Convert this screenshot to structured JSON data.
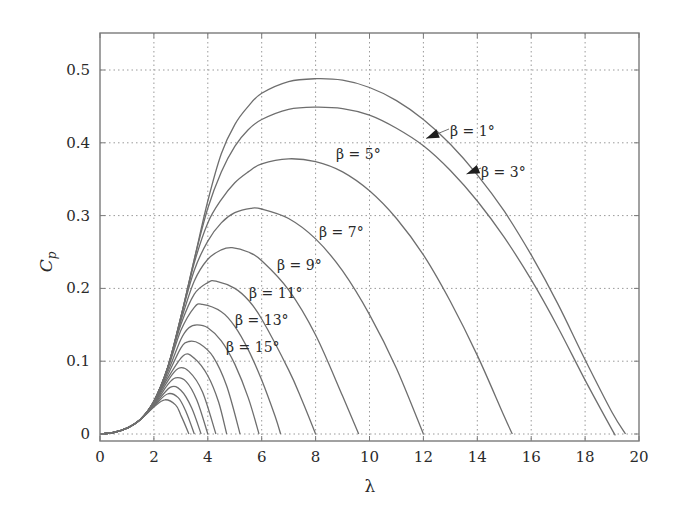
{
  "chart_data": {
    "type": "line",
    "title": "",
    "xlabel": "λ",
    "ylabel": "C_p",
    "xlim": [
      0,
      20
    ],
    "ylim": [
      0,
      0.55
    ],
    "x_ticks": [
      "0",
      "2",
      "4",
      "6",
      "8",
      "10",
      "12",
      "14",
      "16",
      "18",
      "20"
    ],
    "x_tick_values": [
      0,
      2,
      4,
      6,
      8,
      10,
      12,
      14,
      16,
      18,
      20
    ],
    "y_ticks": [
      "0",
      "0.1",
      "0.2",
      "0.3",
      "0.4",
      "0.5"
    ],
    "y_tick_values": [
      0,
      0.1,
      0.2,
      0.3,
      0.4,
      0.5
    ],
    "grid": true,
    "series": [
      {
        "name": "β = 1°",
        "label": "β = 1°",
        "peak": [
          8.3,
          0.488
        ],
        "zero": 19.5,
        "points": [
          [
            0,
            0
          ],
          [
            0.5,
            0.002
          ],
          [
            1,
            0.008
          ],
          [
            1.5,
            0.02
          ],
          [
            2,
            0.045
          ],
          [
            2.5,
            0.09
          ],
          [
            3,
            0.16
          ],
          [
            3.5,
            0.24
          ],
          [
            4,
            0.32
          ],
          [
            4.5,
            0.385
          ],
          [
            5,
            0.425
          ],
          [
            5.5,
            0.45
          ],
          [
            6,
            0.468
          ],
          [
            7,
            0.484
          ],
          [
            8,
            0.488
          ],
          [
            9,
            0.486
          ],
          [
            10,
            0.476
          ],
          [
            11,
            0.458
          ],
          [
            12,
            0.432
          ],
          [
            13,
            0.398
          ],
          [
            14,
            0.356
          ],
          [
            15,
            0.306
          ],
          [
            16,
            0.246
          ],
          [
            17,
            0.178
          ],
          [
            18,
            0.102
          ],
          [
            19,
            0.03
          ],
          [
            19.5,
            0
          ]
        ]
      },
      {
        "name": "β = 3°",
        "label": "β = 3°",
        "peak": [
          8.5,
          0.449
        ],
        "zero": 19.1,
        "points": [
          [
            0,
            0
          ],
          [
            0.5,
            0.002
          ],
          [
            1,
            0.008
          ],
          [
            1.5,
            0.02
          ],
          [
            2,
            0.045
          ],
          [
            2.5,
            0.09
          ],
          [
            3,
            0.16
          ],
          [
            3.5,
            0.24
          ],
          [
            4,
            0.31
          ],
          [
            4.5,
            0.36
          ],
          [
            5,
            0.395
          ],
          [
            5.5,
            0.418
          ],
          [
            6,
            0.432
          ],
          [
            7,
            0.446
          ],
          [
            8,
            0.449
          ],
          [
            9,
            0.447
          ],
          [
            10,
            0.438
          ],
          [
            11,
            0.42
          ],
          [
            12,
            0.396
          ],
          [
            13,
            0.362
          ],
          [
            14,
            0.32
          ],
          [
            15,
            0.27
          ],
          [
            16,
            0.212
          ],
          [
            17,
            0.146
          ],
          [
            18,
            0.074
          ],
          [
            19,
            0.006
          ],
          [
            19.1,
            0
          ]
        ]
      },
      {
        "name": "β = 5°",
        "label": "β = 5°",
        "peak": [
          7.0,
          0.378
        ],
        "zero": 15.3,
        "points": [
          [
            0,
            0
          ],
          [
            0.5,
            0.002
          ],
          [
            1,
            0.008
          ],
          [
            1.5,
            0.02
          ],
          [
            2,
            0.045
          ],
          [
            2.5,
            0.09
          ],
          [
            3,
            0.16
          ],
          [
            3.5,
            0.235
          ],
          [
            4,
            0.29
          ],
          [
            4.5,
            0.322
          ],
          [
            5,
            0.345
          ],
          [
            5.5,
            0.36
          ],
          [
            6,
            0.371
          ],
          [
            7,
            0.378
          ],
          [
            8,
            0.374
          ],
          [
            9,
            0.36
          ],
          [
            10,
            0.334
          ],
          [
            11,
            0.296
          ],
          [
            12,
            0.246
          ],
          [
            13,
            0.182
          ],
          [
            14,
            0.108
          ],
          [
            15,
            0.024
          ],
          [
            15.3,
            0
          ]
        ]
      },
      {
        "name": "β = 7°",
        "label": "β = 7°",
        "peak": [
          5.6,
          0.31
        ],
        "zero": 12.0,
        "points": [
          [
            0,
            0
          ],
          [
            0.5,
            0.002
          ],
          [
            1,
            0.008
          ],
          [
            1.5,
            0.02
          ],
          [
            2,
            0.045
          ],
          [
            2.5,
            0.09
          ],
          [
            3,
            0.16
          ],
          [
            3.5,
            0.225
          ],
          [
            4,
            0.265
          ],
          [
            4.5,
            0.29
          ],
          [
            5,
            0.304
          ],
          [
            5.6,
            0.31
          ],
          [
            6,
            0.309
          ],
          [
            7,
            0.296
          ],
          [
            8,
            0.268
          ],
          [
            9,
            0.224
          ],
          [
            10,
            0.164
          ],
          [
            11,
            0.09
          ],
          [
            12,
            0
          ]
        ]
      },
      {
        "name": "β = 9°",
        "label": "β = 9°",
        "peak": [
          4.9,
          0.256
        ],
        "zero": 9.6,
        "points": [
          [
            0,
            0
          ],
          [
            0.5,
            0.002
          ],
          [
            1,
            0.008
          ],
          [
            1.5,
            0.02
          ],
          [
            2,
            0.045
          ],
          [
            2.5,
            0.09
          ],
          [
            3,
            0.155
          ],
          [
            3.5,
            0.21
          ],
          [
            4,
            0.24
          ],
          [
            4.5,
            0.253
          ],
          [
            4.9,
            0.256
          ],
          [
            5.5,
            0.25
          ],
          [
            6,
            0.238
          ],
          [
            7,
            0.198
          ],
          [
            8,
            0.136
          ],
          [
            9,
            0.052
          ],
          [
            9.6,
            0
          ]
        ]
      },
      {
        "name": "β = 11°",
        "label": "β = 11°",
        "peak": [
          4.3,
          0.21
        ],
        "zero": 8.0,
        "points": [
          [
            0,
            0
          ],
          [
            0.5,
            0.002
          ],
          [
            1,
            0.008
          ],
          [
            1.5,
            0.02
          ],
          [
            2,
            0.045
          ],
          [
            2.5,
            0.09
          ],
          [
            3,
            0.15
          ],
          [
            3.5,
            0.192
          ],
          [
            4,
            0.208
          ],
          [
            4.3,
            0.21
          ],
          [
            5,
            0.2
          ],
          [
            5.5,
            0.184
          ],
          [
            6,
            0.158
          ],
          [
            7,
            0.088
          ],
          [
            7.5,
            0.046
          ],
          [
            8,
            0
          ]
        ]
      },
      {
        "name": "β = 13°",
        "label": "β = 13°",
        "peak": [
          3.8,
          0.178
        ],
        "zero": 6.7,
        "points": [
          [
            0,
            0
          ],
          [
            0.5,
            0.002
          ],
          [
            1,
            0.008
          ],
          [
            1.5,
            0.02
          ],
          [
            2,
            0.045
          ],
          [
            2.5,
            0.088
          ],
          [
            3,
            0.142
          ],
          [
            3.5,
            0.174
          ],
          [
            3.8,
            0.178
          ],
          [
            4.5,
            0.168
          ],
          [
            5,
            0.148
          ],
          [
            5.5,
            0.116
          ],
          [
            6,
            0.074
          ],
          [
            6.5,
            0.024
          ],
          [
            6.7,
            0
          ]
        ]
      },
      {
        "name": "β = 15°",
        "label": "β = 15°",
        "peak": [
          3.6,
          0.15
        ],
        "zero": 5.9,
        "points": [
          [
            0,
            0
          ],
          [
            0.5,
            0.002
          ],
          [
            1,
            0.008
          ],
          [
            1.5,
            0.02
          ],
          [
            2,
            0.044
          ],
          [
            2.5,
            0.084
          ],
          [
            3,
            0.13
          ],
          [
            3.3,
            0.146
          ],
          [
            3.6,
            0.15
          ],
          [
            4,
            0.146
          ],
          [
            4.5,
            0.128
          ],
          [
            5,
            0.096
          ],
          [
            5.5,
            0.05
          ],
          [
            5.9,
            0
          ]
        ]
      },
      {
        "name": "β = 17°",
        "label": "",
        "peak": [
          3.3,
          0.127
        ],
        "zero": 5.2,
        "points": [
          [
            0,
            0
          ],
          [
            0.5,
            0.002
          ],
          [
            1,
            0.008
          ],
          [
            1.5,
            0.02
          ],
          [
            2,
            0.043
          ],
          [
            2.5,
            0.08
          ],
          [
            3,
            0.118
          ],
          [
            3.3,
            0.127
          ],
          [
            3.7,
            0.124
          ],
          [
            4.2,
            0.106
          ],
          [
            4.7,
            0.066
          ],
          [
            5.2,
            0
          ]
        ]
      },
      {
        "name": "β = 19°",
        "label": "",
        "peak": [
          3.1,
          0.108
        ],
        "zero": 4.7,
        "points": [
          [
            0,
            0
          ],
          [
            0.5,
            0.002
          ],
          [
            1,
            0.008
          ],
          [
            1.5,
            0.02
          ],
          [
            2,
            0.042
          ],
          [
            2.5,
            0.076
          ],
          [
            3.1,
            0.108
          ],
          [
            3.5,
            0.104
          ],
          [
            4,
            0.08
          ],
          [
            4.4,
            0.044
          ],
          [
            4.7,
            0
          ]
        ]
      },
      {
        "name": "β = 21°",
        "label": "",
        "peak": [
          2.9,
          0.09
        ],
        "zero": 4.3,
        "points": [
          [
            0,
            0
          ],
          [
            0.5,
            0.002
          ],
          [
            1,
            0.008
          ],
          [
            1.5,
            0.02
          ],
          [
            2,
            0.041
          ],
          [
            2.5,
            0.072
          ],
          [
            2.9,
            0.09
          ],
          [
            3.3,
            0.086
          ],
          [
            3.8,
            0.058
          ],
          [
            4.3,
            0
          ]
        ]
      },
      {
        "name": "β = 23°",
        "label": "",
        "peak": [
          2.8,
          0.077
        ],
        "zero": 4.0,
        "points": [
          [
            0,
            0
          ],
          [
            0.5,
            0.002
          ],
          [
            1,
            0.008
          ],
          [
            1.5,
            0.02
          ],
          [
            2,
            0.04
          ],
          [
            2.5,
            0.067
          ],
          [
            2.8,
            0.077
          ],
          [
            3.2,
            0.072
          ],
          [
            3.6,
            0.046
          ],
          [
            4.0,
            0
          ]
        ]
      },
      {
        "name": "β = 25°",
        "label": "",
        "peak": [
          2.6,
          0.064
        ],
        "zero": 3.75,
        "points": [
          [
            0,
            0
          ],
          [
            0.5,
            0.002
          ],
          [
            1,
            0.008
          ],
          [
            1.5,
            0.02
          ],
          [
            2,
            0.039
          ],
          [
            2.6,
            0.064
          ],
          [
            3,
            0.06
          ],
          [
            3.4,
            0.036
          ],
          [
            3.75,
            0
          ]
        ]
      },
      {
        "name": "β = 27°",
        "label": "",
        "peak": [
          2.5,
          0.055
        ],
        "zero": 3.5,
        "points": [
          [
            0,
            0
          ],
          [
            0.5,
            0.002
          ],
          [
            1,
            0.008
          ],
          [
            1.5,
            0.02
          ],
          [
            2,
            0.038
          ],
          [
            2.5,
            0.055
          ],
          [
            2.9,
            0.05
          ],
          [
            3.2,
            0.03
          ],
          [
            3.5,
            0
          ]
        ]
      },
      {
        "name": "β = 29°",
        "label": "",
        "peak": [
          2.4,
          0.047
        ],
        "zero": 3.3,
        "points": [
          [
            0,
            0
          ],
          [
            0.5,
            0.002
          ],
          [
            1,
            0.008
          ],
          [
            1.5,
            0.02
          ],
          [
            2,
            0.037
          ],
          [
            2.4,
            0.047
          ],
          [
            2.8,
            0.04
          ],
          [
            3.0,
            0.026
          ],
          [
            3.3,
            0
          ]
        ]
      }
    ],
    "annotations": [
      {
        "text": "β = 1°",
        "series": "β = 1°",
        "arrow": true,
        "arrow_target": [
          12.1,
          0.406
        ]
      },
      {
        "text": "β = 3°",
        "series": "β = 3°",
        "arrow": true,
        "arrow_target": [
          13.6,
          0.357
        ]
      },
      {
        "text": "β = 5°",
        "series": "β = 5°",
        "arrow": false
      },
      {
        "text": "β = 7°",
        "series": "β = 7°",
        "arrow": false
      },
      {
        "text": "β = 9°",
        "series": "β = 9°",
        "arrow": false
      },
      {
        "text": "β = 11°",
        "series": "β = 11°",
        "arrow": false
      },
      {
        "text": "β = 13°",
        "series": "β = 13°",
        "arrow": false
      },
      {
        "text": "β = 15°",
        "series": "β = 15°",
        "arrow": false
      }
    ],
    "legend": "none"
  }
}
